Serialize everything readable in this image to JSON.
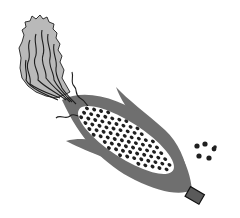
{
  "image": {
    "subject": "corn cob illustration",
    "width": 240,
    "height": 218,
    "background": "#ffffff"
  },
  "colors": {
    "husk": "#6f6f6f",
    "husk_dark": "#5a5a5a",
    "silk_fill": "#b9b9b9",
    "silk_stroke": "#1e1e1e",
    "cob": "#ffffff",
    "kernel": "#1f1f1f",
    "stem_fill": "#5a5a5a",
    "stem_stroke": "#111111"
  },
  "cob": {
    "cx": 126,
    "cy": 140,
    "rx": 56,
    "ry": 19,
    "angle": 33,
    "kernel_rows": 7,
    "kernel_cols": 16
  },
  "loose_kernels": [
    {
      "x": 197,
      "y": 146,
      "r": 2.6
    },
    {
      "x": 205,
      "y": 144,
      "r": 2.6
    },
    {
      "x": 214,
      "y": 149,
      "r": 2.4
    },
    {
      "x": 199,
      "y": 156,
      "r": 2.6
    },
    {
      "x": 209,
      "y": 158,
      "r": 2.6
    },
    {
      "x": 215,
      "y": 147,
      "r": 1.8
    }
  ]
}
